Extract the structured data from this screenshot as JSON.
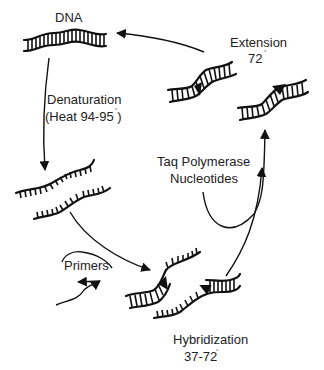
{
  "diagram": {
    "labels": {
      "dna": "DNA",
      "denaturation": "Denaturation",
      "denaturation_temp": "(Heat 94-95 )",
      "primers": "Primers",
      "hybridization": "Hybridization",
      "hybridization_temp": "37-72",
      "extension": "Extension",
      "extension_temp": "72",
      "taq": "Taq Polymerase",
      "nucleotides": "Nucleotides",
      "degree_mark": "°"
    },
    "stages": [
      {
        "id": "dna",
        "name": "DNA"
      },
      {
        "id": "denaturation",
        "name": "Denaturation",
        "temp": "94-95"
      },
      {
        "id": "hybridization",
        "name": "Hybridization",
        "temp": "37-72"
      },
      {
        "id": "extension",
        "name": "Extension",
        "temp": "72"
      }
    ],
    "colors": {
      "ink": "#111111",
      "text": "#222222",
      "background": "#ffffff"
    }
  }
}
